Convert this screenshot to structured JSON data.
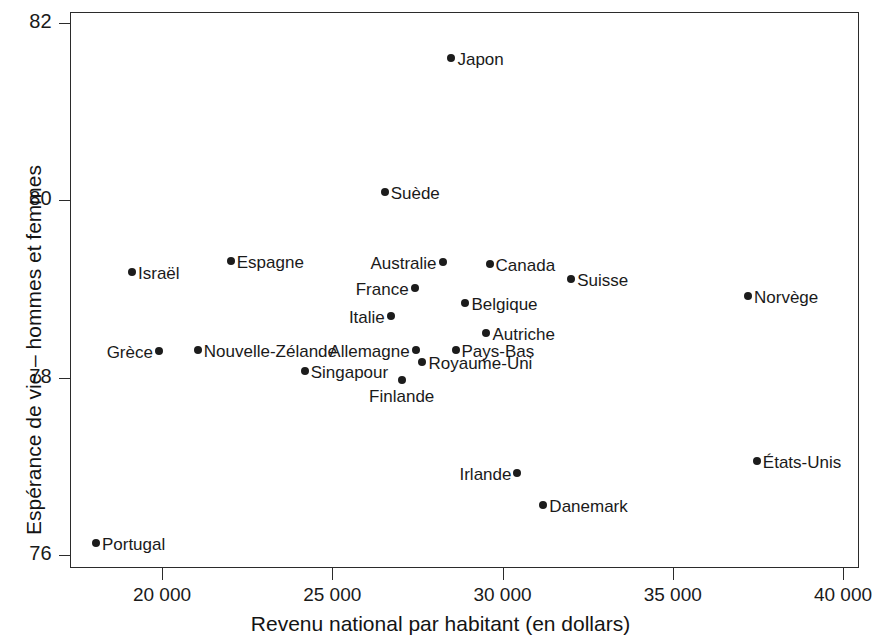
{
  "chart_data": {
    "type": "scatter",
    "title": "",
    "xlabel": "Revenu national par habitant (en dollars)",
    "ylabel": "Espérance de vie – hommes et femmes",
    "xlim": [
      17000,
      40500
    ],
    "ylim": [
      75.8,
      82.15
    ],
    "grid": false,
    "legend": null,
    "xticks": [
      {
        "value": 20000,
        "label": "20 000"
      },
      {
        "value": 25000,
        "label": "25 000"
      },
      {
        "value": 30000,
        "label": "30 000"
      },
      {
        "value": 35000,
        "label": "35 000"
      },
      {
        "value": 40000,
        "label": "40 000"
      }
    ],
    "yticks": [
      {
        "value": 82,
        "label": "82"
      },
      {
        "value": 80,
        "label": "80"
      },
      {
        "value": 78,
        "label": "78"
      },
      {
        "value": 76,
        "label": "76"
      }
    ],
    "marker_color": "#1c1c1c",
    "points": [
      {
        "label": "Japon",
        "x": 28500,
        "y": 81.6,
        "anchor": "right"
      },
      {
        "label": "Suède",
        "x": 26540,
        "y": 80.09,
        "anchor": "right"
      },
      {
        "label": "Espagne",
        "x": 22020,
        "y": 79.32,
        "anchor": "right"
      },
      {
        "label": "Israël",
        "x": 19120,
        "y": 79.19,
        "anchor": "right"
      },
      {
        "label": "Canada",
        "x": 29620,
        "y": 79.28,
        "anchor": "right"
      },
      {
        "label": "Australie",
        "x": 28240,
        "y": 79.31,
        "anchor": "left"
      },
      {
        "label": "Suisse",
        "x": 32020,
        "y": 79.11,
        "anchor": "right"
      },
      {
        "label": "Norvège",
        "x": 37210,
        "y": 78.92,
        "anchor": "right"
      },
      {
        "label": "France",
        "x": 27420,
        "y": 79.01,
        "anchor": "left"
      },
      {
        "label": "Belgique",
        "x": 28910,
        "y": 78.84,
        "anchor": "right"
      },
      {
        "label": "Italie",
        "x": 26720,
        "y": 78.7,
        "anchor": "left"
      },
      {
        "label": "Autriche",
        "x": 29530,
        "y": 78.5,
        "anchor": "right"
      },
      {
        "label": "Grèce",
        "x": 19910,
        "y": 78.3,
        "anchor": "left"
      },
      {
        "label": "Nouvelle-Zélande",
        "x": 21050,
        "y": 78.31,
        "anchor": "right"
      },
      {
        "label": "Allemagne",
        "x": 27450,
        "y": 78.31,
        "anchor": "left"
      },
      {
        "label": "Pays-Bas",
        "x": 28620,
        "y": 78.31,
        "anchor": "right"
      },
      {
        "label": "Royaume-Uni",
        "x": 27650,
        "y": 78.18,
        "anchor": "right"
      },
      {
        "label": "Singapour",
        "x": 24190,
        "y": 78.07,
        "anchor": "right"
      },
      {
        "label": "Finlande",
        "x": 27040,
        "y": 77.97,
        "anchor": "below"
      },
      {
        "label": "Irlande",
        "x": 30440,
        "y": 76.92,
        "anchor": "left"
      },
      {
        "label": "Danemark",
        "x": 31200,
        "y": 76.56,
        "anchor": "right"
      },
      {
        "label": "États-Unis",
        "x": 37470,
        "y": 77.06,
        "anchor": "right"
      },
      {
        "label": "Portugal",
        "x": 18060,
        "y": 76.13,
        "anchor": "right"
      }
    ]
  }
}
